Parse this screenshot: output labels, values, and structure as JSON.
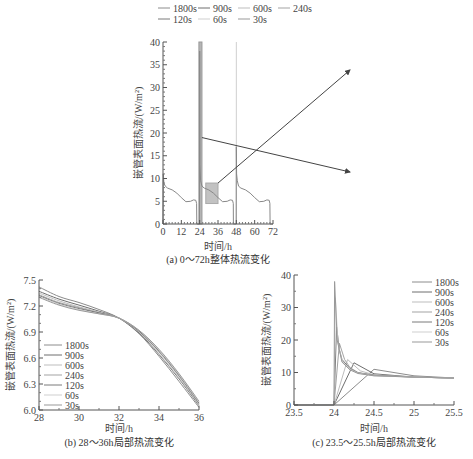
{
  "figure": {
    "legend_top": [
      "1800s",
      "900s",
      "600s",
      "240s",
      "120s",
      "60s",
      "30s"
    ]
  },
  "chart_data": [
    {
      "id": "a",
      "type": "line",
      "title": "(a) 0～72h整体热流变化",
      "xlabel": "时间/h",
      "ylabel": "嵌管表面热流/(W/m²)",
      "xlim": [
        0,
        72
      ],
      "ylim": [
        0,
        40
      ],
      "xticks": [
        0,
        12,
        24,
        36,
        48,
        60,
        72
      ],
      "yticks": [
        0,
        5,
        10,
        15,
        20,
        25,
        30,
        35,
        40
      ],
      "legend": [
        "1800s",
        "900s",
        "600s",
        "240s",
        "120s",
        "60s",
        "30s"
      ],
      "legend_position": "top",
      "series": [
        {
          "name": "heat flux (all step sizes overlap)",
          "x": [
            0,
            0.2,
            0.6,
            1.5,
            3,
            6,
            9,
            12,
            15,
            18,
            20,
            21.5,
            22,
            22.1,
            23.9,
            24,
            24.2,
            24.6,
            25.5,
            27,
            30,
            33,
            36,
            39,
            42,
            44,
            45.5,
            46,
            46.1,
            47.9,
            48,
            48.2,
            48.6,
            49.5,
            51,
            54,
            57,
            60,
            63,
            66,
            68,
            69.5,
            70,
            70.1,
            72
          ],
          "y": [
            0,
            11,
            9,
            8.3,
            7.9,
            7.5,
            6.8,
            5.8,
            4.9,
            5.0,
            5.3,
            5.2,
            4.5,
            0,
            0,
            38,
            13,
            9.5,
            8.3,
            7.9,
            7.5,
            6.8,
            5.8,
            4.9,
            5.0,
            5.3,
            5.2,
            4.5,
            0,
            0,
            17,
            11,
            9.5,
            8.3,
            7.9,
            7.5,
            6.8,
            5.8,
            4.9,
            5.0,
            5.3,
            5.2,
            4.5,
            0,
            0
          ]
        }
      ],
      "annotations": [
        {
          "type": "highlight",
          "x": [
            23.5,
            25.5
          ],
          "y": [
            0,
            40
          ],
          "refers_to": "c"
        },
        {
          "type": "highlight",
          "x": [
            28,
            36
          ],
          "y": [
            4.5,
            9
          ],
          "refers_to": "b"
        },
        {
          "type": "arrow",
          "from": "highlight 28-36h",
          "to": "chart b (top-right)"
        },
        {
          "type": "arrow",
          "from": "highlight 23.5-25.5h",
          "to": "chart c (right)"
        }
      ]
    },
    {
      "id": "b",
      "type": "line",
      "title": "(b) 28～36h局部热流变化",
      "xlabel": "时间/h",
      "ylabel": "嵌管表面热流/(W/m²)",
      "xlim": [
        28,
        36
      ],
      "ylim": [
        6.0,
        7.5
      ],
      "xticks": [
        28,
        30,
        32,
        34,
        36
      ],
      "yticks": [
        6.0,
        6.3,
        6.6,
        6.9,
        7.2,
        7.5
      ],
      "legend_position": "bottom-left",
      "x": [
        28,
        29,
        30,
        31,
        32,
        33,
        34,
        35,
        36
      ],
      "series": [
        {
          "name": "1800s",
          "values": [
            7.42,
            7.31,
            7.24,
            7.16,
            7.06,
            6.88,
            6.62,
            6.33,
            6.03
          ]
        },
        {
          "name": "900s",
          "values": [
            7.37,
            7.28,
            7.21,
            7.14,
            7.06,
            6.89,
            6.64,
            6.36,
            6.05
          ]
        },
        {
          "name": "600s",
          "values": [
            7.35,
            7.26,
            7.19,
            7.13,
            7.06,
            6.9,
            6.65,
            6.37,
            6.06
          ]
        },
        {
          "name": "240s",
          "values": [
            7.33,
            7.24,
            7.18,
            7.12,
            7.06,
            6.91,
            6.67,
            6.39,
            6.07
          ]
        },
        {
          "name": "120s",
          "values": [
            7.32,
            7.23,
            7.17,
            7.12,
            7.06,
            6.91,
            6.68,
            6.4,
            6.08
          ]
        },
        {
          "name": "60s",
          "values": [
            7.31,
            7.22,
            7.16,
            7.11,
            7.06,
            6.92,
            6.69,
            6.41,
            6.09
          ]
        },
        {
          "name": "30s",
          "values": [
            7.3,
            7.21,
            7.15,
            7.11,
            7.06,
            6.92,
            6.7,
            6.42,
            6.1
          ]
        }
      ]
    },
    {
      "id": "c",
      "type": "line",
      "title": "(c) 23.5～25.5h局部热流变化",
      "xlabel": "时间/h",
      "ylabel": "嵌管表面热流/(W/m²)",
      "xlim": [
        23.5,
        25.5
      ],
      "ylim": [
        0,
        40
      ],
      "xticks": [
        23.5,
        24,
        24.5,
        25,
        25.5
      ],
      "yticks": [
        0,
        10,
        20,
        30,
        40
      ],
      "legend_position": "top-right",
      "series": [
        {
          "name": "1800s",
          "x": [
            23.5,
            24,
            24.5,
            25,
            25.5
          ],
          "y": [
            0,
            0,
            11,
            9,
            8.3
          ]
        },
        {
          "name": "900s",
          "x": [
            23.5,
            24,
            24.25,
            24.5,
            25,
            25.5
          ],
          "y": [
            0,
            0,
            13,
            9.6,
            8.6,
            8.3
          ]
        },
        {
          "name": "600s",
          "x": [
            23.5,
            24,
            24.17,
            24.33,
            24.5,
            25,
            25.5
          ],
          "y": [
            0,
            0,
            14,
            10.5,
            9.3,
            8.6,
            8.3
          ]
        },
        {
          "name": "240s",
          "x": [
            23.5,
            24,
            24.067,
            24.133,
            24.2,
            24.3,
            24.5,
            25,
            25.5
          ],
          "y": [
            0,
            0,
            19,
            14,
            11.5,
            10,
            9.2,
            8.6,
            8.3
          ]
        },
        {
          "name": "120s",
          "x": [
            23.5,
            24,
            24.033,
            24.067,
            24.1,
            24.2,
            24.3,
            24.5,
            25,
            25.5
          ],
          "y": [
            0,
            0,
            24,
            17,
            14,
            11.2,
            9.9,
            9.1,
            8.6,
            8.3
          ]
        },
        {
          "name": "60s",
          "x": [
            23.5,
            24,
            24.017,
            24.05,
            24.1,
            24.2,
            24.3,
            24.5,
            25,
            25.5
          ],
          "y": [
            0,
            0,
            33,
            19,
            13.5,
            11,
            9.8,
            9.0,
            8.6,
            8.3
          ]
        },
        {
          "name": "30s",
          "x": [
            23.5,
            24,
            24.008,
            24.04,
            24.1,
            24.2,
            24.3,
            24.5,
            25,
            25.5
          ],
          "y": [
            0,
            0,
            38,
            20,
            13.2,
            10.8,
            9.7,
            9.0,
            8.6,
            8.3
          ]
        }
      ]
    }
  ]
}
